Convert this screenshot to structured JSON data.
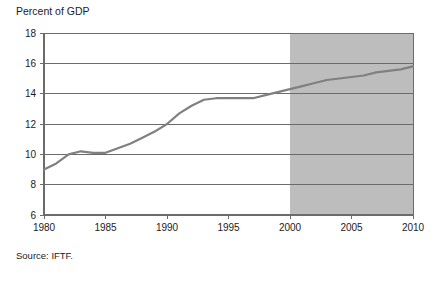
{
  "chart_data": {
    "type": "line",
    "title": "Percent of GDP",
    "xlabel": "",
    "ylabel": "Percent of GDP",
    "xlim": [
      1980,
      2010
    ],
    "ylim": [
      6,
      18
    ],
    "grid": true,
    "legend": null,
    "xticks": [
      1980,
      1985,
      1990,
      1995,
      2000,
      2005,
      2010
    ],
    "ytick_labels": [
      "18",
      "16",
      "14",
      "12",
      "10",
      "8",
      "6"
    ],
    "yticks": [
      18,
      16,
      14,
      12,
      10,
      8,
      6
    ],
    "annotations": {
      "shaded_region": {
        "label": "projection",
        "x_start": 2000,
        "x_end": 2010,
        "color": "#bdbdbd"
      }
    },
    "series": [
      {
        "name": "Health spending",
        "color": "#808080",
        "x": [
          1980,
          1981,
          1982,
          1983,
          1984,
          1985,
          1986,
          1987,
          1988,
          1989,
          1990,
          1991,
          1992,
          1993,
          1994,
          1995,
          1996,
          1997,
          1998,
          1999,
          2000,
          2001,
          2002,
          2003,
          2004,
          2005,
          2006,
          2007,
          2008,
          2009,
          2010
        ],
        "values": [
          9.0,
          9.4,
          10.0,
          10.2,
          10.1,
          10.1,
          10.4,
          10.7,
          11.1,
          11.5,
          12.0,
          12.7,
          13.2,
          13.6,
          13.7,
          13.7,
          13.7,
          13.7,
          13.9,
          14.1,
          14.3,
          14.5,
          14.7,
          14.9,
          15.0,
          15.1,
          15.2,
          15.4,
          15.5,
          15.6,
          15.8
        ]
      }
    ],
    "source": "Source: IFTF."
  },
  "figure": {
    "axis_title": "Percent of GDP",
    "source_note": "Source: IFTF.",
    "colors": {
      "line": "#808080",
      "shade": "#bdbdbd",
      "grid": "#6b6b6b",
      "axis": "#6b6b6b",
      "background": "#ffffff",
      "text": "#1c1c1c"
    }
  }
}
